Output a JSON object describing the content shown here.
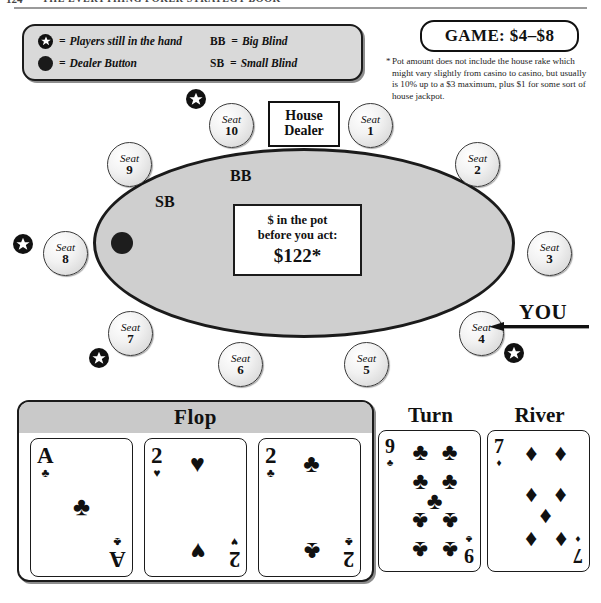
{
  "running_head": {
    "page_number": "124",
    "title": "THE EVERYTHING POKER STRATEGY BOOK"
  },
  "legend": {
    "items": [
      {
        "icon": "star-icon",
        "equals": "=",
        "label": "Players still in the hand"
      },
      {
        "icon": "dealer-button-icon",
        "equals": "=",
        "label": "Dealer Button"
      }
    ],
    "abbreviations": [
      {
        "abbr": "BB",
        "equals": "=",
        "label": "Big Blind"
      },
      {
        "abbr": "SB",
        "equals": "=",
        "label": "Small Blind"
      }
    ]
  },
  "game": {
    "badge_label": "GAME: $4–$8",
    "footnote_marker": "*",
    "footnote": "Pot amount does not include the house rake which might vary slightly from casino to casino, but usually is 10% up to a $3 maximum, plus $1 for some sort of house jackpot."
  },
  "table": {
    "house_dealer": {
      "line1": "House",
      "line2": "Dealer"
    },
    "blinds": {
      "small_blind": "SB",
      "big_blind": "BB"
    },
    "pot": {
      "line1": "$ in the pot",
      "line2": "before you act:",
      "amount": "$122*"
    },
    "you_label": "YOU",
    "seat_word": "Seat",
    "seats": [
      {
        "number": "10",
        "in_hand": true
      },
      {
        "number": "1",
        "in_hand": false
      },
      {
        "number": "2",
        "in_hand": false
      },
      {
        "number": "3",
        "in_hand": false
      },
      {
        "number": "4",
        "in_hand": true
      },
      {
        "number": "5",
        "in_hand": false
      },
      {
        "number": "6",
        "in_hand": false
      },
      {
        "number": "7",
        "in_hand": true
      },
      {
        "number": "8",
        "in_hand": true
      },
      {
        "number": "9",
        "in_hand": false
      }
    ]
  },
  "board": {
    "flop_label": "Flop",
    "turn_label": "Turn",
    "river_label": "River",
    "flop": [
      {
        "rank": "A",
        "suit": "clubs",
        "suit_glyph": "♣",
        "count": 1
      },
      {
        "rank": "2",
        "suit": "hearts",
        "suit_glyph": "♥",
        "count": 2
      },
      {
        "rank": "2",
        "suit": "clubs",
        "suit_glyph": "♣",
        "count": 2
      }
    ],
    "turn": {
      "rank": "9",
      "suit": "clubs",
      "suit_glyph": "♣",
      "count": 9
    },
    "river": {
      "rank": "7",
      "suit": "diamonds",
      "suit_glyph": "♦",
      "count": 7
    }
  },
  "colors": {
    "table_felt": "#cfcfcf",
    "ink": "#1b1b1b",
    "panel_gray": "#d9d9d9",
    "header_gray": "#c9c9c9"
  }
}
